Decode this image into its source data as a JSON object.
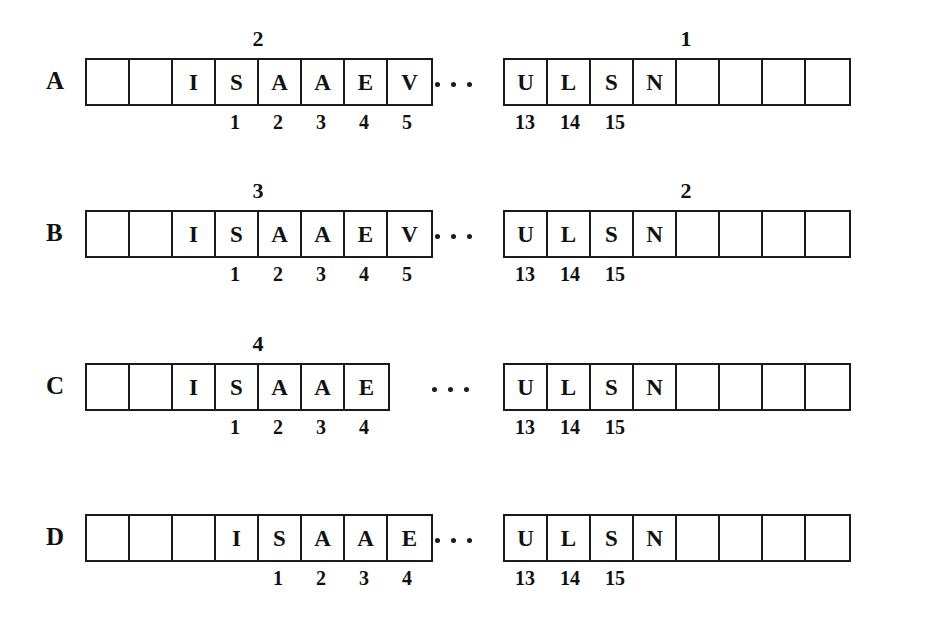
{
  "figure": {
    "ink_color": "#1a1a1a",
    "background": "#ffffff",
    "ellipsis": "..."
  },
  "rows": [
    {
      "label": "A",
      "left_grid": {
        "x": 85,
        "cells": [
          "",
          "",
          "I",
          "S",
          "A",
          "A",
          "E",
          "V"
        ],
        "superscript": {
          "text": "2",
          "offset_x": 173
        },
        "indices": [
          {
            "text": "1",
            "offset_x": 150
          },
          {
            "text": "2",
            "offset_x": 193
          },
          {
            "text": "3",
            "offset_x": 236
          },
          {
            "text": "4",
            "offset_x": 279
          },
          {
            "text": "5",
            "offset_x": 322
          }
        ]
      },
      "dots": {
        "x": 435,
        "count": 3
      },
      "right_grid": {
        "x": 503,
        "cells": [
          "U",
          "L",
          "S",
          "N",
          "",
          "",
          "",
          ""
        ],
        "superscript": {
          "text": "1",
          "offset_x": 183
        },
        "indices": [
          {
            "text": "13",
            "offset_x": 22
          },
          {
            "text": "14",
            "offset_x": 67
          },
          {
            "text": "15",
            "offset_x": 112
          }
        ]
      }
    },
    {
      "label": "B",
      "left_grid": {
        "x": 85,
        "cells": [
          "",
          "",
          "I",
          "S",
          "A",
          "A",
          "E",
          "V"
        ],
        "superscript": {
          "text": "3",
          "offset_x": 173
        },
        "indices": [
          {
            "text": "1",
            "offset_x": 150
          },
          {
            "text": "2",
            "offset_x": 193
          },
          {
            "text": "3",
            "offset_x": 236
          },
          {
            "text": "4",
            "offset_x": 279
          },
          {
            "text": "5",
            "offset_x": 322
          }
        ]
      },
      "dots": {
        "x": 435,
        "count": 3
      },
      "right_grid": {
        "x": 503,
        "cells": [
          "U",
          "L",
          "S",
          "N",
          "",
          "",
          "",
          ""
        ],
        "superscript": {
          "text": "2",
          "offset_x": 183
        },
        "indices": [
          {
            "text": "13",
            "offset_x": 22
          },
          {
            "text": "14",
            "offset_x": 67
          },
          {
            "text": "15",
            "offset_x": 112
          }
        ]
      }
    },
    {
      "label": "C",
      "left_grid": {
        "x": 85,
        "cells": [
          "",
          "",
          "I",
          "S",
          "A",
          "A",
          "E"
        ],
        "superscript": {
          "text": "4",
          "offset_x": 173
        },
        "indices": [
          {
            "text": "1",
            "offset_x": 150
          },
          {
            "text": "2",
            "offset_x": 193
          },
          {
            "text": "3",
            "offset_x": 236
          },
          {
            "text": "4",
            "offset_x": 279
          }
        ]
      },
      "dots": {
        "x": 432,
        "count": 3
      },
      "right_grid": {
        "x": 503,
        "cells": [
          "U",
          "L",
          "S",
          "N",
          "",
          "",
          "",
          ""
        ],
        "superscript": null,
        "indices": [
          {
            "text": "13",
            "offset_x": 22
          },
          {
            "text": "14",
            "offset_x": 67
          },
          {
            "text": "15",
            "offset_x": 112
          }
        ]
      }
    },
    {
      "label": "D",
      "left_grid": {
        "x": 85,
        "cells": [
          "",
          "",
          "",
          "I",
          "S",
          "A",
          "A",
          "E"
        ],
        "superscript": null,
        "indices": [
          {
            "text": "1",
            "offset_x": 193
          },
          {
            "text": "2",
            "offset_x": 236
          },
          {
            "text": "3",
            "offset_x": 279
          },
          {
            "text": "4",
            "offset_x": 322
          }
        ]
      },
      "dots": {
        "x": 435,
        "count": 3
      },
      "right_grid": {
        "x": 503,
        "cells": [
          "U",
          "L",
          "S",
          "N",
          "",
          "",
          "",
          ""
        ],
        "superscript": null,
        "indices": [
          {
            "text": "13",
            "offset_x": 22
          },
          {
            "text": "14",
            "offset_x": 67
          },
          {
            "text": "15",
            "offset_x": 112
          }
        ]
      }
    }
  ]
}
